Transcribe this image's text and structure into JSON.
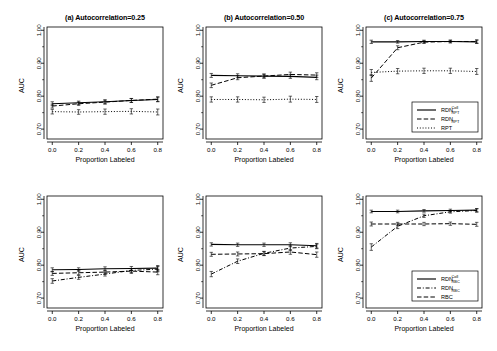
{
  "figure": {
    "axis": {
      "ylabel": "AUC",
      "xlabel": "Proportion Labeled",
      "yticks": [
        "0.70",
        "0.80",
        "0.90",
        "1.00"
      ],
      "ytickvals": [
        0.7,
        0.8,
        0.9,
        1.0
      ],
      "xticks": [
        "0.0",
        "0.2",
        "0.4",
        "0.6",
        "0.8"
      ],
      "xtickvals": [
        0.0,
        0.2,
        0.4,
        0.6,
        0.8
      ],
      "ylim": [
        0.67,
        1.01
      ],
      "xlim": [
        -0.04,
        0.84
      ]
    }
  },
  "chart_data": [
    {
      "id": "top-a",
      "type": "line",
      "title": "(a) Autocorrelation=0.25",
      "xlabel": "Proportion Labeled",
      "ylabel": "AUC",
      "x": [
        0.0,
        0.2,
        0.4,
        0.6,
        0.8
      ],
      "xlim": [
        -0.04,
        0.84
      ],
      "ylim": [
        0.67,
        1.01
      ],
      "grid": false,
      "legend": "none",
      "series": [
        {
          "name": "RDN_RPT^Coll",
          "style": "solid",
          "values": [
            0.777,
            0.78,
            0.783,
            0.787,
            0.79
          ],
          "errors": [
            0.006,
            0.005,
            0.006,
            0.006,
            0.007
          ]
        },
        {
          "name": "RDN_RPT",
          "style": "dashed",
          "values": [
            0.77,
            0.777,
            0.782,
            0.787,
            0.791
          ],
          "errors": [
            0.006,
            0.005,
            0.006,
            0.006,
            0.007
          ]
        },
        {
          "name": "RPT",
          "style": "dotted",
          "values": [
            0.753,
            0.752,
            0.753,
            0.754,
            0.752
          ],
          "errors": [
            0.007,
            0.007,
            0.008,
            0.008,
            0.009
          ]
        }
      ]
    },
    {
      "id": "top-b",
      "type": "line",
      "title": "(b) Autocorrelation=0.50",
      "xlabel": "Proportion Labeled",
      "ylabel": "AUC",
      "x": [
        0.0,
        0.2,
        0.4,
        0.6,
        0.8
      ],
      "xlim": [
        -0.04,
        0.84
      ],
      "ylim": [
        0.67,
        1.01
      ],
      "grid": false,
      "legend": "none",
      "series": [
        {
          "name": "RDN_RPT^Coll",
          "style": "solid",
          "values": [
            0.863,
            0.862,
            0.861,
            0.86,
            0.857
          ],
          "errors": [
            0.006,
            0.006,
            0.006,
            0.006,
            0.007
          ]
        },
        {
          "name": "RDN_RPT",
          "style": "dashed",
          "values": [
            0.833,
            0.856,
            0.861,
            0.866,
            0.864
          ],
          "errors": [
            0.007,
            0.006,
            0.006,
            0.007,
            0.007
          ]
        },
        {
          "name": "RPT",
          "style": "dotted",
          "values": [
            0.79,
            0.79,
            0.789,
            0.791,
            0.79
          ],
          "errors": [
            0.008,
            0.008,
            0.008,
            0.009,
            0.009
          ]
        }
      ]
    },
    {
      "id": "top-c",
      "type": "line",
      "title": "(c) Autocorrelation=0.75",
      "xlabel": "Proportion Labeled",
      "ylabel": "AUC",
      "x": [
        0.0,
        0.2,
        0.4,
        0.6,
        0.8
      ],
      "xlim": [
        -0.04,
        0.84
      ],
      "ylim": [
        0.67,
        1.01
      ],
      "grid": false,
      "legend": "bottom-right",
      "series": [
        {
          "name": "RDN_RPT^Coll",
          "style": "solid",
          "values": [
            0.965,
            0.965,
            0.966,
            0.966,
            0.965
          ],
          "errors": [
            0.005,
            0.004,
            0.004,
            0.004,
            0.005
          ]
        },
        {
          "name": "RDN_RPT",
          "style": "dashed",
          "values": [
            0.855,
            0.947,
            0.964,
            0.966,
            0.966
          ],
          "errors": [
            0.01,
            0.006,
            0.004,
            0.004,
            0.005
          ]
        },
        {
          "name": "RPT",
          "style": "dotted",
          "values": [
            0.872,
            0.876,
            0.877,
            0.877,
            0.875
          ],
          "errors": [
            0.009,
            0.008,
            0.008,
            0.008,
            0.009
          ]
        }
      ]
    },
    {
      "id": "bottom-a",
      "type": "line",
      "title": "",
      "xlabel": "Proportion Labeled",
      "ylabel": "AUC",
      "x": [
        0.0,
        0.2,
        0.4,
        0.6,
        0.8
      ],
      "xlim": [
        -0.04,
        0.84
      ],
      "ylim": [
        0.67,
        1.01
      ],
      "grid": false,
      "legend": "none",
      "series": [
        {
          "name": "RDN_RBC^Coll",
          "style": "solid",
          "values": [
            0.786,
            0.787,
            0.789,
            0.79,
            0.791
          ],
          "errors": [
            0.006,
            0.005,
            0.006,
            0.006,
            0.008
          ]
        },
        {
          "name": "RDN_RBC",
          "style": "dashdot",
          "values": [
            0.752,
            0.763,
            0.773,
            0.784,
            0.788
          ],
          "errors": [
            0.007,
            0.006,
            0.006,
            0.006,
            0.008
          ]
        },
        {
          "name": "RBC",
          "style": "dashed",
          "values": [
            0.775,
            0.777,
            0.779,
            0.782,
            0.779
          ],
          "errors": [
            0.006,
            0.006,
            0.006,
            0.007,
            0.008
          ]
        }
      ]
    },
    {
      "id": "bottom-b",
      "type": "line",
      "title": "",
      "xlabel": "Proportion Labeled",
      "ylabel": "AUC",
      "x": [
        0.0,
        0.2,
        0.4,
        0.6,
        0.8
      ],
      "xlim": [
        -0.04,
        0.84
      ],
      "ylim": [
        0.67,
        1.01
      ],
      "grid": false,
      "legend": "none",
      "series": [
        {
          "name": "RDN_RBC^Coll",
          "style": "solid",
          "values": [
            0.863,
            0.862,
            0.862,
            0.862,
            0.859
          ],
          "errors": [
            0.005,
            0.005,
            0.005,
            0.006,
            0.007
          ]
        },
        {
          "name": "RDN_RBC",
          "style": "dashdot",
          "values": [
            0.773,
            0.812,
            0.836,
            0.852,
            0.857
          ],
          "errors": [
            0.008,
            0.007,
            0.006,
            0.007,
            0.007
          ]
        },
        {
          "name": "RBC",
          "style": "dashed",
          "values": [
            0.833,
            0.834,
            0.835,
            0.84,
            0.832
          ],
          "errors": [
            0.006,
            0.006,
            0.006,
            0.007,
            0.008
          ]
        }
      ]
    },
    {
      "id": "bottom-c",
      "type": "line",
      "title": "",
      "xlabel": "Proportion Labeled",
      "ylabel": "AUC",
      "x": [
        0.0,
        0.2,
        0.4,
        0.6,
        0.8
      ],
      "xlim": [
        -0.04,
        0.84
      ],
      "ylim": [
        0.67,
        1.01
      ],
      "grid": false,
      "legend": "bottom-right",
      "series": [
        {
          "name": "RDN_RBC^Coll",
          "style": "solid",
          "values": [
            0.963,
            0.963,
            0.965,
            0.966,
            0.967
          ],
          "errors": [
            0.004,
            0.004,
            0.004,
            0.004,
            0.005
          ]
        },
        {
          "name": "RDN_RBC",
          "style": "dashdot",
          "values": [
            0.855,
            0.918,
            0.95,
            0.962,
            0.966
          ],
          "errors": [
            0.01,
            0.007,
            0.005,
            0.004,
            0.005
          ]
        },
        {
          "name": "RBC",
          "style": "dashed",
          "values": [
            0.925,
            0.925,
            0.925,
            0.926,
            0.924
          ],
          "errors": [
            0.006,
            0.005,
            0.005,
            0.005,
            0.006
          ]
        }
      ]
    }
  ],
  "legends": {
    "top": {
      "entries": [
        {
          "base": "RDN",
          "sup": "Coll",
          "sub": "RPT",
          "style": "solid"
        },
        {
          "base": "RDN",
          "sup": "",
          "sub": "RPT",
          "style": "dashed"
        },
        {
          "base": "RPT",
          "sup": "",
          "sub": "",
          "style": "dotted"
        }
      ]
    },
    "bottom": {
      "entries": [
        {
          "base": "RDN",
          "sup": "Coll",
          "sub": "RBC",
          "style": "solid"
        },
        {
          "base": "RDN",
          "sup": "",
          "sub": "RBC",
          "style": "dashdot"
        },
        {
          "base": "RBC",
          "sup": "",
          "sub": "",
          "style": "dashed"
        }
      ]
    }
  }
}
